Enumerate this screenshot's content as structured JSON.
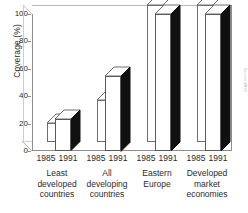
{
  "chart_data": {
    "type": "bar",
    "title": "",
    "subtitle": "",
    "xlabel": "",
    "ylabel": "Coverage (%)",
    "ylim": [
      0,
      100
    ],
    "yticks": [
      0,
      20,
      40,
      60,
      80,
      100
    ],
    "ytick_labels": [
      "0",
      "20",
      "40",
      "60",
      "80",
      "100"
    ],
    "grid": false,
    "legend_position": "none",
    "style": "3d-bar",
    "categories": [
      "Least developed countries",
      "All developing countries",
      "Eastern Europe",
      "Developed market economies"
    ],
    "category_lines": [
      [
        "Least",
        "developed",
        "countries"
      ],
      [
        "All",
        "developing",
        "countries"
      ],
      [
        "Eastern",
        "Europe"
      ],
      [
        "Developed",
        "market",
        "economies"
      ]
    ],
    "series": [
      {
        "name": "1985",
        "values": [
          14,
          31,
          100,
          100
        ]
      },
      {
        "name": "1991",
        "values": [
          23,
          55,
          100,
          100
        ]
      }
    ],
    "annotations": []
  },
  "axis": {
    "y_title": "Coverage (%)"
  },
  "source": {
    "credit": "Source: WHO"
  }
}
